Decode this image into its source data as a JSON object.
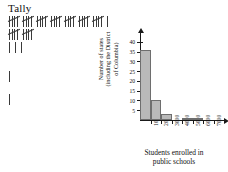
{
  "tally": {
    "title": "Tally",
    "rows": [
      {
        "groups": 7,
        "singles": 1,
        "count": 36
      },
      {
        "groups": 2,
        "singles": 0,
        "count": 10
      },
      {
        "groups": 0,
        "singles": 3,
        "count": 3
      },
      {
        "groups": 0,
        "singles": 1,
        "count": 1
      },
      {
        "groups": 0,
        "singles": 1,
        "count": 1
      }
    ]
  },
  "chart_data": {
    "type": "bar",
    "title": "",
    "subtitle": "",
    "xlabel": "Students enrolled in public schools",
    "ylabel": "Number of states (including the District of Columbia)",
    "ylabel_lines": [
      "Number of states",
      "(including the District",
      "of Columbia)"
    ],
    "xlabel_lines": [
      "Students enrolled in",
      "public schools"
    ],
    "categories": [
      "1000",
      "2000",
      "3000",
      "4000",
      "5000",
      "6000",
      "7000"
    ],
    "xticks": [
      "1000",
      "2000",
      "3000",
      "4000",
      "5000",
      "6000",
      "7000"
    ],
    "yticks": [
      5,
      10,
      15,
      20,
      25,
      30,
      35,
      40
    ],
    "values": [
      36,
      10,
      3,
      0,
      1,
      1,
      0
    ],
    "ylim": [
      0,
      42
    ],
    "grid": false,
    "legend": false,
    "bar_fill": "#b9b9b9",
    "bar_stroke": "#6e6e6e",
    "axis_color": "#1a1a1a"
  }
}
